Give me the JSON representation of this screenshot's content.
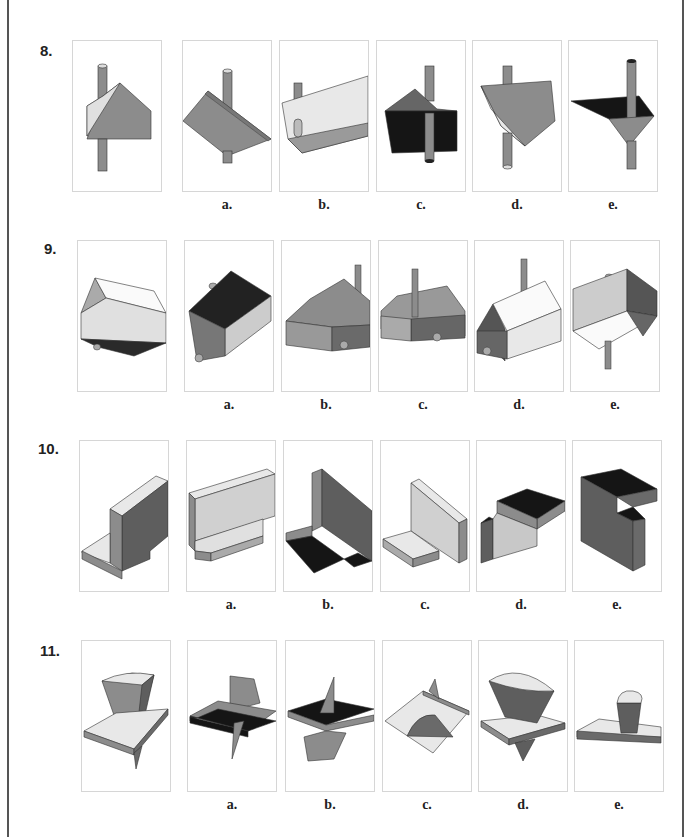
{
  "page": {
    "type": "mental-rotation-test",
    "colors": {
      "light": "#e8e8e8",
      "mid": "#8c8c8c",
      "dark": "#5e5e5e",
      "black": "#151515",
      "edge": "#333333",
      "frame": "#d6d6d6"
    }
  },
  "questions": [
    {
      "number": "8.",
      "reference": "prism-with-rod",
      "options": [
        {
          "label": "a."
        },
        {
          "label": "b."
        },
        {
          "label": "c."
        },
        {
          "label": "d."
        },
        {
          "label": "e."
        }
      ]
    },
    {
      "number": "9.",
      "reference": "house-with-pegs",
      "options": [
        {
          "label": "a."
        },
        {
          "label": "b."
        },
        {
          "label": "c."
        },
        {
          "label": "d."
        },
        {
          "label": "e."
        }
      ]
    },
    {
      "number": "10.",
      "reference": "l-bracket",
      "options": [
        {
          "label": "a."
        },
        {
          "label": "b."
        },
        {
          "label": "c."
        },
        {
          "label": "d."
        },
        {
          "label": "e."
        }
      ]
    },
    {
      "number": "11.",
      "reference": "plate-with-frustum-and-cone",
      "options": [
        {
          "label": "a."
        },
        {
          "label": "b."
        },
        {
          "label": "c."
        },
        {
          "label": "d."
        },
        {
          "label": "e."
        }
      ]
    }
  ]
}
